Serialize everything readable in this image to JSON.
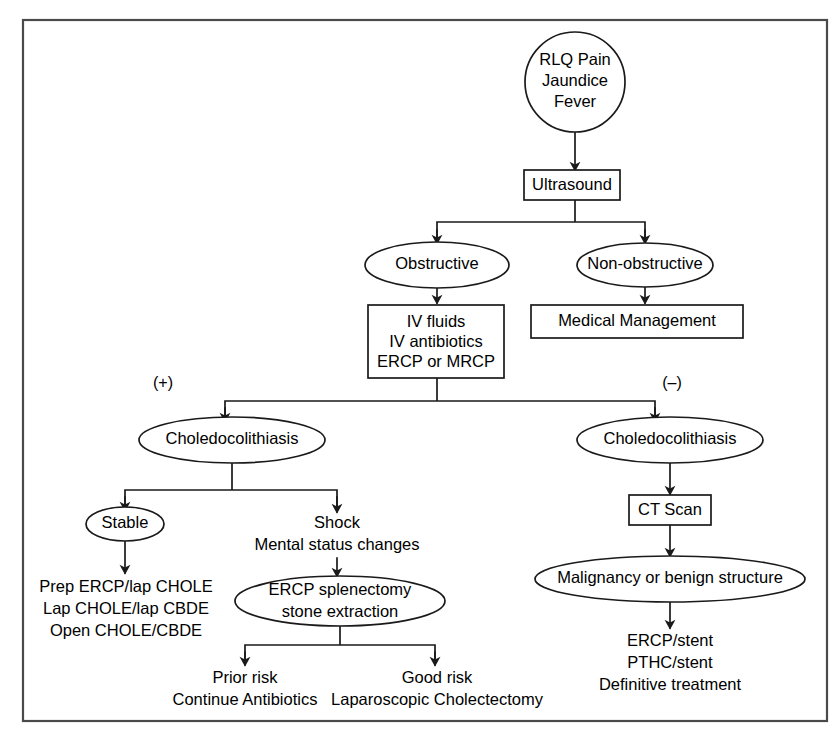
{
  "figure": {
    "border_color": "#4a4a4a",
    "line_color": "#1a1a1a",
    "background_color": "#ffffff"
  },
  "nodes": {
    "presentation": {
      "shape": "circle",
      "line1": "RLQ Pain",
      "line2": "Jaundice",
      "line3": "Fever"
    },
    "ultrasound": {
      "shape": "box",
      "label": "Ultrasound"
    },
    "obstructive": {
      "shape": "ellipse",
      "label": "Obstructive"
    },
    "non_obstructive": {
      "shape": "ellipse",
      "label": "Non-obstructive"
    },
    "initial_management": {
      "shape": "box",
      "line1": "IV fluids",
      "line2": "IV antibiotics",
      "line3": "ERCP or MRCP"
    },
    "medical_management": {
      "shape": "box",
      "label": "Medical Management"
    },
    "choledocolithiasis_positive": {
      "shape": "ellipse",
      "label": "Choledocolithiasis"
    },
    "choledocolithiasis_negative": {
      "shape": "ellipse",
      "label": "Choledocolithiasis"
    },
    "stable": {
      "shape": "ellipse",
      "label": "Stable"
    },
    "shock": {
      "shape": "text",
      "line1": "Shock",
      "line2": "Mental status changes"
    },
    "stable_treatment": {
      "shape": "text",
      "line1": "Prep ERCP/lap CHOLE",
      "line2": "Lap CHOLE/lap CBDE",
      "line3": "Open CHOLE/CBDE"
    },
    "ercp_splenectomy": {
      "shape": "ellipse",
      "line1": "ERCP splenectomy",
      "line2": "stone extraction"
    },
    "prior_risk": {
      "shape": "text",
      "line1": "Prior risk",
      "line2": "Continue Antibiotics"
    },
    "good_risk": {
      "shape": "text",
      "line1": "Good risk",
      "line2": "Laparoscopic Cholectectomy"
    },
    "ct_scan": {
      "shape": "box",
      "label": "CT Scan"
    },
    "malignancy": {
      "shape": "ellipse",
      "label": "Malignancy or benign structure"
    },
    "definitive_treatment": {
      "shape": "text",
      "line1": "ERCP/stent",
      "line2": "PTHC/stent",
      "line3": "Definitive treatment"
    }
  },
  "edge_labels": {
    "positive": "(+)",
    "negative": "(–)"
  }
}
